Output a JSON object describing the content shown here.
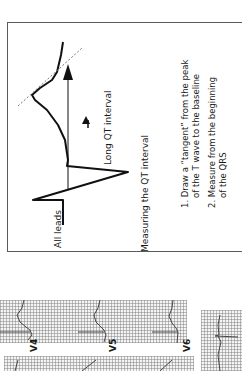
{
  "figure": {
    "orientation": "rotated-90-ccw",
    "lead_label": "All leads",
    "arrow_label": "Long QT interval",
    "caption": "Measuring the QT interval",
    "steps": [
      "1.  Draw a “tangent” from the peak",
      "of the T wave to the baseline",
      "2.  Measure from the beginning",
      "of the QRS"
    ]
  },
  "ecg_strips": {
    "leads": [
      "V4",
      "V5",
      "V6"
    ],
    "grid_color": "#8a8a8a",
    "trace_color": "#333333"
  }
}
